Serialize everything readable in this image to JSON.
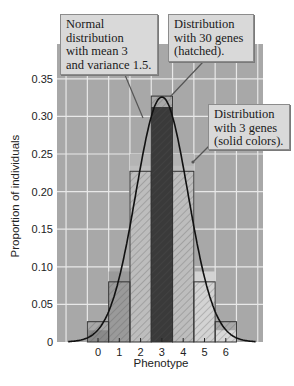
{
  "chart_data": {
    "type": "bar",
    "title": "",
    "xlabel": "Phenotype",
    "ylabel": "Proportion of individuals",
    "categories": [
      "0",
      "1",
      "2",
      "3",
      "4",
      "5",
      "6"
    ],
    "ylim": [
      0,
      0.37
    ],
    "yticks": [
      "0",
      "0.05",
      "0.10",
      "0.15",
      "0.20",
      "0.25",
      "0.30",
      "0.35"
    ],
    "grid": true,
    "series": [
      {
        "name": "Distribution with 3 genes (solid colors)",
        "style": "solid",
        "values": [
          0.0156,
          0.0938,
          0.2344,
          0.3125,
          0.2344,
          0.0938,
          0.0156
        ],
        "colors": [
          "#8a8a8a",
          "#9a9a9a",
          "#bdbdbd",
          "#3a3a3a",
          "#bdbdbd",
          "#d3d3d3",
          "#d8d8d8"
        ]
      },
      {
        "name": "Distribution with 30 genes (hatched)",
        "style": "hatched",
        "values": [
          0.027,
          0.08,
          0.227,
          0.327,
          0.227,
          0.08,
          0.027
        ]
      },
      {
        "name": "Normal distribution with mean 3 and variance 1.5",
        "style": "curve",
        "mean": 3,
        "variance": 1.5
      }
    ],
    "annotations": [
      {
        "lines": [
          "Normal",
          "distribution",
          "with mean 3",
          "and variance 1.5."
        ]
      },
      {
        "lines": [
          "Distribution",
          "with 30 genes",
          "(hatched)."
        ]
      },
      {
        "lines": [
          "Distribution",
          "with 3 genes",
          "(solid colors)."
        ]
      }
    ]
  },
  "colors": {
    "plot_bg": "#a8a8a8",
    "grid": "#e8e8e8",
    "curve": "#111111",
    "callout_bg": "#d9d9d9"
  }
}
